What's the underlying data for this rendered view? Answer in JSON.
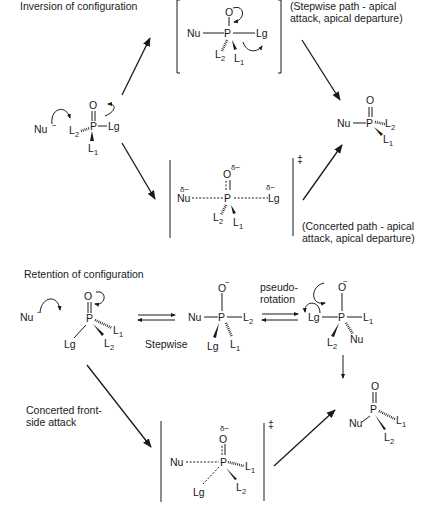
{
  "sections": {
    "inversion": {
      "title": "Inversion of configuration",
      "stepwise_caption": [
        "(Stepwise path - apical",
        "attack, apical departure)"
      ],
      "concerted_caption": [
        "(Concerted path - apical",
        "attack, apical departure)"
      ]
    },
    "retention": {
      "title": "Retention of configuration",
      "stepwise_label": "Stepwise",
      "pseudorotation_label": [
        "pseudo-",
        "rotation"
      ],
      "concerted_caption": [
        "Concerted front-",
        "side attack"
      ]
    }
  },
  "atoms": {
    "nu": "Nu",
    "p": "P",
    "o": "O",
    "lg": "Lg",
    "l": "L",
    "sub1": "1",
    "sub2": "2",
    "minus": "−",
    "delta_minus": "δ−",
    "double_dagger": "‡"
  }
}
